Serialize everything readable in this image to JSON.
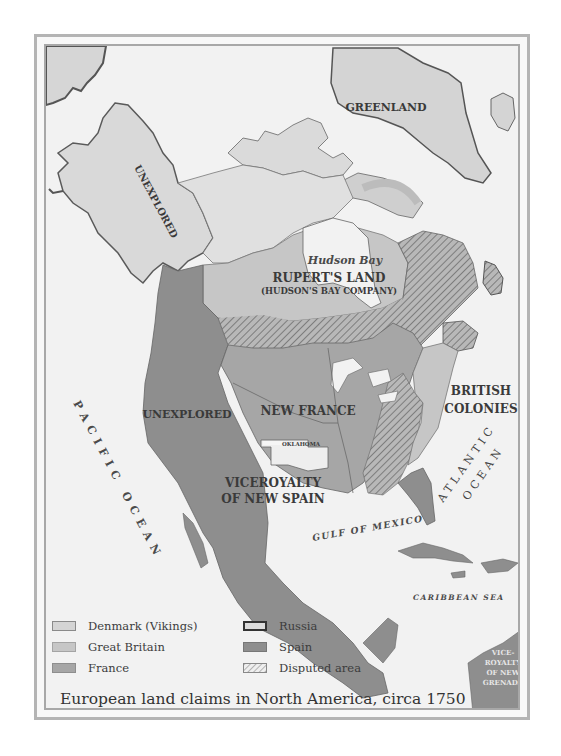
{
  "map": {
    "title": "European land claims in North America, circa 1750",
    "regions": {
      "greenland": "GREENLAND",
      "alaska_unexplored": "UNEXPLORED",
      "hudson_bay": "Hudson Bay",
      "ruperts_land": "RUPERT'S LAND",
      "hudsons_bay_company": "(HUDSON'S BAY COMPANY)",
      "west_unexplored": "UNEXPLORED",
      "new_france": "NEW FRANCE",
      "british_colonies_line1": "BRITISH",
      "british_colonies_line2": "COLONIES",
      "oklahoma": "OKLAHOMA",
      "new_spain_line1": "VICEROYALTY",
      "new_spain_line2": "OF NEW SPAIN",
      "new_granada_line1": "VICE-",
      "new_granada_line2": "ROYALTY",
      "new_granada_line3": "OF NEW",
      "new_granada_line4": "GRENADA"
    },
    "water": {
      "pacific": "PACIFIC  OCEAN",
      "atlantic_line1": "ATLANTIC",
      "atlantic_line2": "OCEAN",
      "gulf": "GULF OF MEXICO",
      "caribbean": "CARIBBEAN SEA"
    },
    "colors": {
      "background": "#f2f2f2",
      "denmark": "#d4d4d4",
      "great_britain": "#c6c6c6",
      "france": "#a6a6a6",
      "russia": "#dcdcdc",
      "spain": "#8e8e8e",
      "unexplored": "#d9d9d9",
      "border": "#5a5a5a"
    }
  },
  "legend": {
    "items": [
      {
        "label": "Denmark (Vikings)",
        "key": "denmark"
      },
      {
        "label": "Great Britain",
        "key": "great_britain"
      },
      {
        "label": "France",
        "key": "france"
      },
      {
        "label": "Russia",
        "key": "russia"
      },
      {
        "label": "Spain",
        "key": "spain"
      },
      {
        "label": "Disputed area",
        "key": "disputed"
      }
    ]
  }
}
